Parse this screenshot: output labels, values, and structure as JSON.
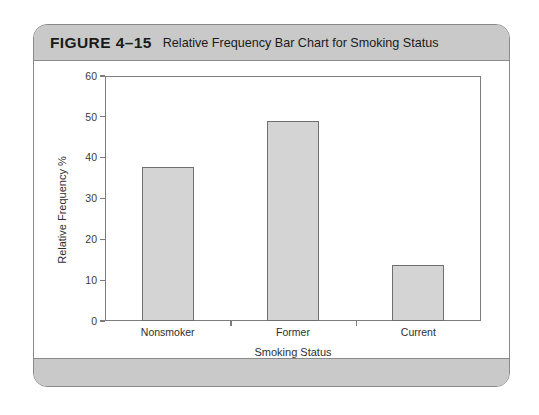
{
  "figure": {
    "label": "FIGURE 4–15",
    "title": "Relative Frequency Bar Chart for Smoking Status"
  },
  "colors": {
    "header_bar": "#c9c9c9",
    "card_border": "#8a8a8a",
    "bar_fill": "#d4d4d4",
    "bar_stroke": "#6f6f6f",
    "axis": "#7d7d7d",
    "text": "#2e2e2e",
    "background": "#ffffff"
  },
  "chart_data": {
    "type": "bar",
    "title": "Relative Frequency Bar Chart for Smoking Status",
    "categories": [
      "Nonsmoker",
      "Former",
      "Current"
    ],
    "values": [
      37.8,
      48.9,
      13.6
    ],
    "xlabel": "Smoking Status",
    "ylabel": "Relative Frequency %",
    "ylim": [
      0,
      60
    ],
    "yticks": [
      0,
      10,
      20,
      30,
      40,
      50,
      60
    ],
    "ytick_labels": [
      "0",
      "10",
      "20",
      "30",
      "40",
      "50",
      "60"
    ],
    "grid": false,
    "legend": false
  }
}
